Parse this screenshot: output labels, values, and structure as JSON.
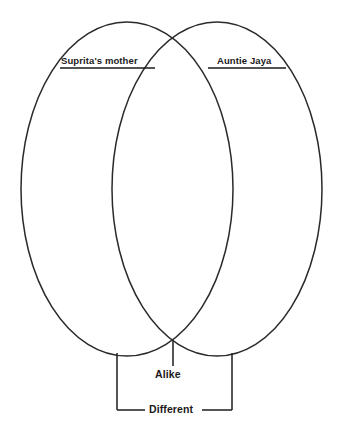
{
  "diagram": {
    "type": "venn",
    "title": "",
    "background_color": "#ffffff",
    "stroke_color": "#2a2a2a",
    "text_color": "#1a1a1a",
    "left_set_label": "Suprita's mother",
    "right_set_label": "Auntie Jaya",
    "intersection_label": "Alike",
    "outer_label": "Different",
    "left_circle": {
      "cx": 127,
      "cy": 189,
      "rx": 106,
      "ry": 167
    },
    "right_circle": {
      "cx": 217,
      "cy": 189,
      "rx": 105,
      "ry": 167
    },
    "leader_lines": {
      "alike_pointer_x": 173,
      "alike_pointer_top_y": 341,
      "alike_pointer_bottom_y": 366,
      "different_bracket_left_x": 117,
      "different_bracket_right_x": 232,
      "different_bracket_top_y": 353,
      "different_bracket_bottom_y": 410
    },
    "underlines": {
      "left": {
        "x1": 60,
        "x2": 155,
        "y": 68
      },
      "right": {
        "x1": 208,
        "x2": 286,
        "y": 68
      }
    }
  }
}
